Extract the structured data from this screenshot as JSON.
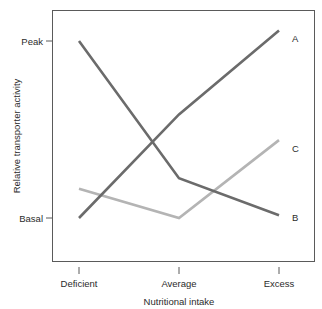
{
  "chart_data": {
    "type": "line",
    "title": "",
    "xlabel": "Nutritional intake",
    "ylabel": "Relative transporter activity",
    "categories": [
      "Deficient",
      "Average",
      "Excess"
    ],
    "x_tick_labels": [
      "Deficient",
      "Average",
      "Excess"
    ],
    "y_tick_labels": [
      "Peak",
      "Basal"
    ],
    "ylim": [
      0,
      1.15
    ],
    "y_tick_values": [
      1.0,
      0.0
    ],
    "grid": false,
    "legend_position": "right-inline-end-labels",
    "series": [
      {
        "name": "A",
        "label": "A",
        "color": "#6b6b6b",
        "values": [
          0.0,
          0.585,
          1.06
        ],
        "x": [
          "Deficient",
          "Average",
          "Excess"
        ]
      },
      {
        "name": "B",
        "label": "B",
        "color": "#6b6b6b",
        "values": [
          1.0,
          0.225,
          0.015
        ],
        "x": [
          "Deficient",
          "Average",
          "Excess"
        ]
      },
      {
        "name": "C",
        "label": "C",
        "color": "#b4b4b4",
        "values": [
          0.165,
          0.0,
          0.44
        ],
        "x": [
          "Deficient",
          "Average",
          "Excess"
        ]
      }
    ]
  },
  "axes": {
    "y_title": "Relative transporter activity",
    "x_title": "Nutritional intake",
    "y_ticks": [
      {
        "label": "Peak",
        "y": 41
      },
      {
        "label": "Basal",
        "y": 218
      }
    ],
    "x_ticks": [
      {
        "label": "Deficient",
        "x": 79
      },
      {
        "label": "Average",
        "x": 179
      },
      {
        "label": "Excess",
        "x": 279
      }
    ]
  },
  "series_labels": [
    {
      "text": "A",
      "x": 292,
      "y": 42
    },
    {
      "text": "C",
      "x": 292,
      "y": 152
    },
    {
      "text": "B",
      "x": 292,
      "y": 221
    }
  ],
  "colors": {
    "dark_line": "#6b6b6b",
    "light_line": "#b4b4b4",
    "frame": "#5a5a5a",
    "text": "#2b2b2b",
    "background": "#ffffff"
  }
}
